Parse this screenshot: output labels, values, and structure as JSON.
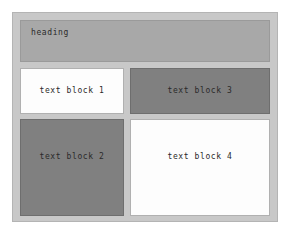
{
  "page": {
    "background_color": "#ffffff"
  },
  "layout": {
    "container_color": "#c8c8c8",
    "container_border_color": "#b4b4b4",
    "heading": {
      "label": "heading",
      "background_color": "#a8a8a8",
      "text_color": "#2a2a2a"
    },
    "blocks": [
      {
        "label": "text block 1",
        "background_color": "#fdfdfd",
        "text_color": "#2a2a2a",
        "position": "top-left"
      },
      {
        "label": "text block 3",
        "background_color": "#808080",
        "text_color": "#2a2a2a",
        "position": "top-right"
      },
      {
        "label": "text block 2",
        "background_color": "#808080",
        "text_color": "#2a2a2a",
        "position": "bottom-left"
      },
      {
        "label": "text block 4",
        "background_color": "#fdfdfd",
        "text_color": "#2a2a2a",
        "position": "bottom-right"
      }
    ]
  }
}
